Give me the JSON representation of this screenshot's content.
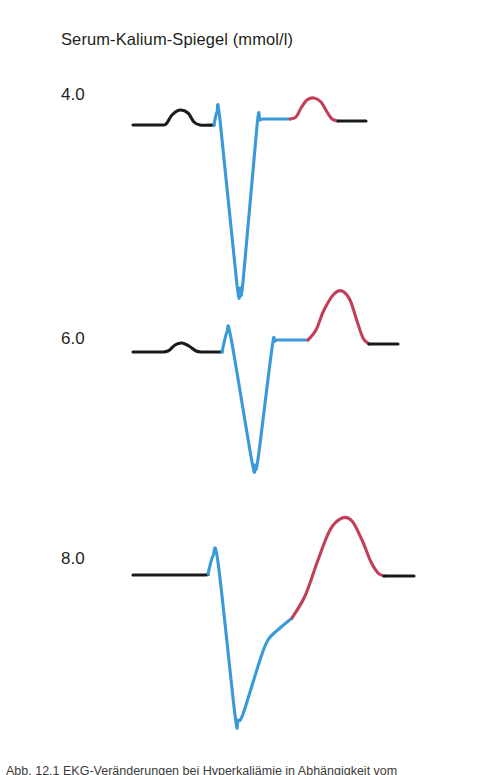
{
  "figure": {
    "title": "Serum-Kalium-Spiegel (mmol/l)",
    "caption": "Abb. 12.1 EKG-Veränderungen bei Hyperkaliämie in Abhängigkeit vom",
    "background_color": "#ffffff"
  },
  "colors": {
    "p_wave": "#1a1a1a",
    "qrs_complex": "#3a9ad9",
    "t_wave": "#c0405a",
    "baseline": "#1a1a1a",
    "text": "#231f20"
  },
  "legend_semantics": {
    "black_segment": "P wave and baseline",
    "blue_segment": "QRS complex",
    "red_segment": "T wave"
  },
  "chart_data": {
    "type": "line",
    "title": "Serum-Kalium-Spiegel (mmol/l)",
    "xlabel": "",
    "ylabel": "Serum-Kalium-Spiegel (mmol/l)",
    "grid": false,
    "legend_position": "none",
    "categories": [
      "4.0",
      "6.0",
      "8.0"
    ],
    "series": [
      {
        "name": "4.0",
        "label": "4.0",
        "potassium_mmol_l": 4.0,
        "description": "Normal ECG: normal P wave, narrow QRS, normal T wave",
        "features": {
          "p_wave": "normal",
          "qrs_width": "narrow",
          "t_wave": "normal amplitude"
        },
        "segments": [
          {
            "part": "baseline-and-p-wave",
            "color": "#1a1a1a",
            "points": [
              [
                133,
                125
              ],
              [
                160,
                125
              ],
              [
                166,
                124
              ],
              [
                172,
                115
              ],
              [
                180,
                110
              ],
              [
                188,
                113
              ],
              [
                194,
                122
              ],
              [
                200,
                125
              ],
              [
                214,
                125
              ]
            ]
          },
          {
            "part": "qrs-complex",
            "color": "#3a9ad9",
            "points": [
              [
                214,
                125
              ],
              [
                217,
                112
              ],
              [
                220,
                120
              ],
              [
                237,
                285
              ],
              [
                240,
                288
              ],
              [
                243,
                282
              ],
              [
                257,
                126
              ],
              [
                260,
                120
              ],
              [
                266,
                119
              ],
              [
                290,
                119
              ]
            ]
          },
          {
            "part": "t-wave",
            "color": "#c0405a",
            "points": [
              [
                290,
                119
              ],
              [
                296,
                117
              ],
              [
                301,
                108
              ],
              [
                307,
                100
              ],
              [
                314,
                98
              ],
              [
                321,
                102
              ],
              [
                327,
                112
              ],
              [
                332,
                119
              ],
              [
                338,
                121
              ]
            ]
          },
          {
            "part": "terminal-baseline",
            "color": "#1a1a1a",
            "points": [
              [
                338,
                121
              ],
              [
                366,
                121
              ]
            ]
          }
        ]
      },
      {
        "name": "6.0",
        "label": "6.0",
        "potassium_mmol_l": 6.0,
        "description": "Hyperkalemia: flattened P wave, tall peaked T wave",
        "features": {
          "p_wave": "flattened",
          "qrs_width": "slightly widened",
          "t_wave": "tall and peaked"
        },
        "segments": [
          {
            "part": "baseline-and-p-wave",
            "color": "#1a1a1a",
            "points": [
              [
                133,
                352
              ],
              [
                160,
                352
              ],
              [
                168,
                351
              ],
              [
                175,
                345
              ],
              [
                182,
                343
              ],
              [
                189,
                346
              ],
              [
                196,
                351
              ],
              [
                203,
                352
              ],
              [
                222,
                352
              ]
            ]
          },
          {
            "part": "qrs-complex",
            "color": "#3a9ad9",
            "points": [
              [
                222,
                352
              ],
              [
                227,
                332
              ],
              [
                231,
                338
              ],
              [
                252,
                462
              ],
              [
                255,
                465
              ],
              [
                258,
                459
              ],
              [
                272,
                348
              ],
              [
                275,
                341
              ],
              [
                281,
                340
              ],
              [
                308,
                340
              ]
            ]
          },
          {
            "part": "t-wave",
            "color": "#c0405a",
            "points": [
              [
                308,
                340
              ],
              [
                316,
                330
              ],
              [
                324,
                310
              ],
              [
                334,
                294
              ],
              [
                342,
                291
              ],
              [
                350,
                300
              ],
              [
                357,
                321
              ],
              [
                363,
                338
              ],
              [
                369,
                344
              ]
            ]
          },
          {
            "part": "terminal-baseline",
            "color": "#1a1a1a",
            "points": [
              [
                369,
                344
              ],
              [
                398,
                344
              ]
            ]
          }
        ]
      },
      {
        "name": "8.0",
        "label": "8.0",
        "potassium_mmol_l": 8.0,
        "description": "Severe hyperkalemia: absent P wave, wide QRS merging into broad T wave (sine wave pattern)",
        "features": {
          "p_wave": "absent",
          "qrs_width": "markedly widened",
          "t_wave": "broad and merged with QRS"
        },
        "segments": [
          {
            "part": "baseline",
            "color": "#1a1a1a",
            "points": [
              [
                133,
                575
              ],
              [
                200,
                575
              ],
              [
                208,
                574
              ]
            ]
          },
          {
            "part": "qrs-complex",
            "color": "#3a9ad9",
            "points": [
              [
                208,
                574
              ],
              [
                213,
                556
              ],
              [
                218,
                562
              ],
              [
                235,
                715
              ],
              [
                238,
                720
              ],
              [
                243,
                714
              ],
              [
                260,
                660
              ],
              [
                268,
                640
              ],
              [
                280,
                628
              ],
              [
                292,
                618
              ]
            ]
          },
          {
            "part": "t-wave",
            "color": "#c0405a",
            "points": [
              [
                292,
                618
              ],
              [
                305,
                596
              ],
              [
                318,
                560
              ],
              [
                330,
                530
              ],
              [
                342,
                518
              ],
              [
                352,
                521
              ],
              [
                362,
                540
              ],
              [
                371,
                562
              ],
              [
                378,
                573
              ],
              [
                384,
                576
              ]
            ]
          },
          {
            "part": "terminal-baseline",
            "color": "#1a1a1a",
            "points": [
              [
                384,
                576
              ],
              [
                414,
                576
              ]
            ]
          }
        ]
      }
    ]
  }
}
